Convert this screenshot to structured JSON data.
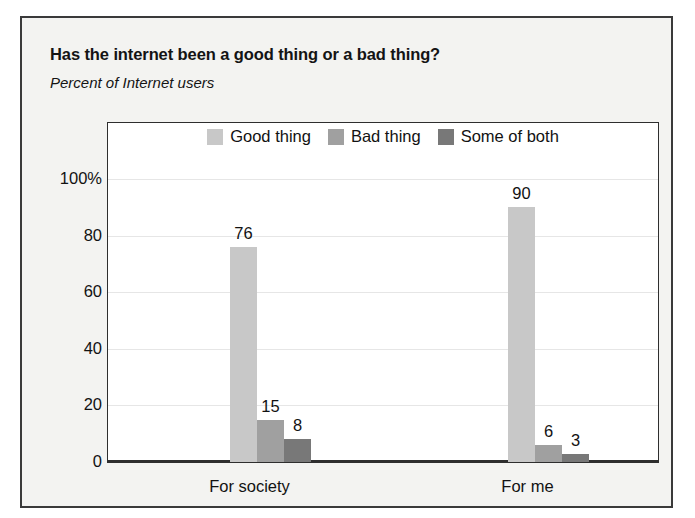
{
  "chart_data": {
    "type": "bar",
    "title": "Has the internet been a good thing or a bad thing?",
    "subtitle": "Percent of Internet users",
    "xlabel": "",
    "ylabel": "",
    "ylim": [
      0,
      100
    ],
    "yticks": [
      "0",
      "20",
      "40",
      "60",
      "80",
      "100%"
    ],
    "ytick_values": [
      0,
      20,
      40,
      60,
      80,
      100
    ],
    "grid": true,
    "legend_position": "top-center",
    "categories": [
      "For society",
      "For me"
    ],
    "series": [
      {
        "name": "Good thing",
        "values": [
          76,
          90
        ],
        "color": "#c8c8c8"
      },
      {
        "name": "Bad thing",
        "values": [
          15,
          6
        ],
        "color": "#a0a0a0"
      },
      {
        "name": "Some of both",
        "values": [
          8,
          3
        ],
        "color": "#787878"
      }
    ],
    "value_labels": [
      {
        "text": "76"
      },
      {
        "text": "15"
      },
      {
        "text": "8"
      },
      {
        "text": "90"
      },
      {
        "text": "6"
      },
      {
        "text": "3"
      }
    ]
  },
  "colors": {
    "good_thing": "#c8c8c8",
    "bad_thing": "#a0a0a0",
    "some_of_both": "#787878",
    "frame_border": "#3a3a3a",
    "panel_background": "#ffffff",
    "figure_background": "#f3f3f1",
    "gridline": "#e6e6e6",
    "text": "#121212"
  }
}
